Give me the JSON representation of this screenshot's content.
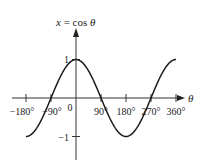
{
  "chart_data": {
    "type": "line",
    "title": "",
    "ylabel": "x = cos θ",
    "ylabel_parts": {
      "var": "x",
      "eq": " = cos ",
      "theta": "θ"
    },
    "xlabel": "θ",
    "x_ticks": [
      -180,
      -90,
      0,
      90,
      180,
      270,
      360
    ],
    "x_tick_labels": [
      "−180°",
      "−90°",
      "0",
      "90°",
      "180°",
      "270°",
      "360°"
    ],
    "y_ticks": [
      1,
      -1
    ],
    "y_tick_labels": [
      "1",
      "−1"
    ],
    "xlim": [
      -180,
      360
    ],
    "ylim": [
      -1,
      1
    ],
    "grid": false,
    "legend": null,
    "series": [
      {
        "name": "cos θ",
        "function": "cos",
        "x": [
          -180,
          -135,
          -90,
          -45,
          0,
          45,
          90,
          135,
          180,
          225,
          270,
          315,
          360
        ],
        "y": [
          -1,
          -0.707,
          0,
          0.707,
          1,
          0.707,
          0,
          -0.707,
          -1,
          -0.707,
          0,
          0.707,
          1
        ]
      }
    ],
    "colors": {
      "curve": "#1a1a1a",
      "axes": "#333333"
    }
  }
}
